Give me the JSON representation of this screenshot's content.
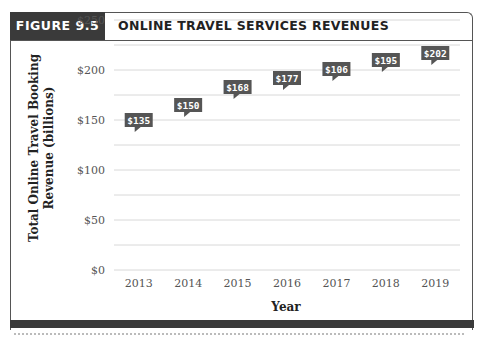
{
  "figure": {
    "tag": "FIGURE 9.5",
    "title": "ONLINE TRAVEL SERVICES REVENUES"
  },
  "chart_data": {
    "type": "bar",
    "style": "pictograph",
    "icon": "airplane-icon",
    "icon_unit": 25,
    "title": "ONLINE TRAVEL SERVICES REVENUES",
    "xlabel": "Year",
    "ylabel": "Total Online Travel Booking Revenue (billions)",
    "categories": [
      "2013",
      "2014",
      "2015",
      "2016",
      "2017",
      "2018",
      "2019"
    ],
    "values": [
      135,
      150,
      168,
      177,
      186,
      195,
      202
    ],
    "data_labels": [
      "$135",
      "$150",
      "$168",
      "$177",
      "$106",
      "$195",
      "$202"
    ],
    "ylim": [
      0,
      250
    ],
    "yticks": [
      0,
      50,
      100,
      150,
      200,
      250
    ],
    "ytick_labels": [
      "$0",
      "$50",
      "$100",
      "$150",
      "$200",
      "$250"
    ],
    "grid": true,
    "colors": {
      "icon": "#9a9a9a",
      "label_bg": "#555555",
      "label_text": "#ffffff",
      "grid": "#d8d8d8"
    }
  }
}
